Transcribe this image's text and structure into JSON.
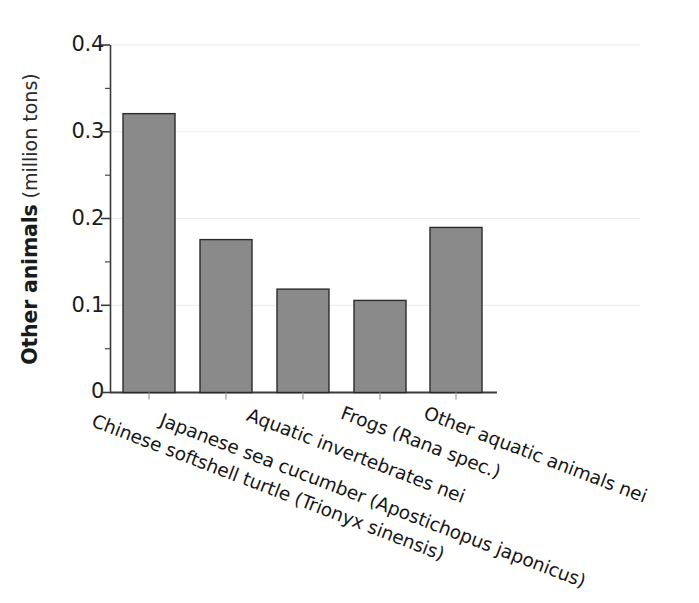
{
  "chart_data": {
    "type": "bar",
    "title": "",
    "xlabel": "",
    "ylabel": "Other animals (million tons)",
    "ylabel_strong": "Other animals",
    "ylabel_unit": " (million tons)",
    "ylim": [
      0,
      0.4
    ],
    "ytick_labels": [
      "0.4",
      "0.3",
      "0.2",
      "0.1",
      "0"
    ],
    "ytick_values": [
      0.4,
      0.3,
      0.2,
      0.1,
      0
    ],
    "minor_tick_values": [
      0.35,
      0.25,
      0.15,
      0.05
    ],
    "grid": "faint-horizontal",
    "legend": "none",
    "bar_color": "#8a8a8a",
    "bar_edge_color": "#2b2b2b",
    "axis_color": "#3a3a3a",
    "categories": [
      "Chinese softshell turtle (Trionyx sinensis)",
      "Japanese sea cucumber (Apostichopus japonicus)",
      "Aquatic invertebrates nei",
      "Frogs (Rana spec.)",
      "Other aquatic animals nei"
    ],
    "values": [
      0.321,
      0.176,
      0.119,
      0.106,
      0.19
    ],
    "units": "million tons"
  },
  "labels": {
    "category_0": "Chinese softshell turtle (Trionyx sinensis)",
    "category_1": "Japanese sea cucumber (Apostichopus japonicus)",
    "category_2": "Aquatic invertebrates nei",
    "category_3": "Frogs (Rana spec.)",
    "category_4": "Other aquatic animals nei"
  },
  "axis": {
    "y0": "0",
    "y1": "0.1",
    "y2": "0.2",
    "y3": "0.3",
    "y4": "0.4"
  }
}
